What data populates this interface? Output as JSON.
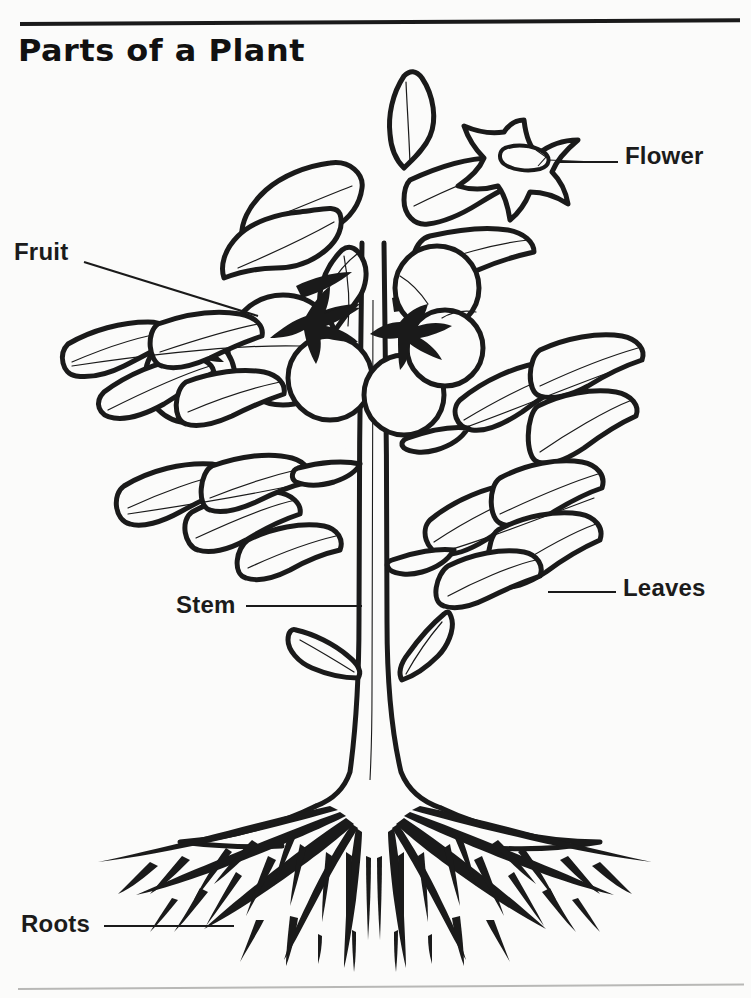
{
  "document": {
    "title": "Parts of a Plant",
    "type": "worksheet-diagram",
    "subject": "Plant anatomy — tomato plant line drawing",
    "background_color": "#fbfbfa",
    "ink_color": "#1a1a1a",
    "has_top_rule": true,
    "has_bottom_rule": true
  },
  "labels": [
    {
      "id": "flower",
      "text": "Flower",
      "x": 625,
      "y": 142,
      "leader": "horizontal-left"
    },
    {
      "id": "fruit",
      "text": "Fruit",
      "x": 14,
      "y": 238,
      "leader": "diagonal-right-down"
    },
    {
      "id": "leaves",
      "text": "Leaves",
      "x": 623,
      "y": 574,
      "leader": "horizontal-left"
    },
    {
      "id": "stem",
      "text": "Stem",
      "x": 176,
      "y": 591,
      "leader": "horizontal-right"
    },
    {
      "id": "roots",
      "text": "Roots",
      "x": 21,
      "y": 910,
      "leader": "horizontal-right"
    }
  ],
  "plant_parts": [
    "flower",
    "fruit",
    "leaves",
    "stem",
    "roots"
  ]
}
